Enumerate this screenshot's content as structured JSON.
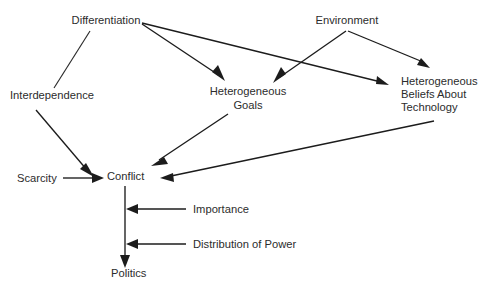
{
  "diagram": {
    "type": "directed-graph",
    "title": "",
    "background_color": "#ffffff",
    "text_color": "#2c2c2c",
    "line_color": "#1c1c1c",
    "nodes": [
      {
        "id": "differentiation",
        "label": "Differentiation",
        "lines": [
          "Differentiation"
        ],
        "x": 106,
        "y": 24,
        "align": "middle"
      },
      {
        "id": "environment",
        "label": "Environment",
        "lines": [
          "Environment"
        ],
        "x": 347,
        "y": 24,
        "align": "middle"
      },
      {
        "id": "interdependence",
        "label": "Interdependence",
        "lines": [
          "Interdependence"
        ],
        "x": 10,
        "y": 99,
        "align": "start"
      },
      {
        "id": "heterogeneous-goals",
        "label": "Heterogeneous Goals",
        "lines": [
          "Heterogeneous",
          "Goals"
        ],
        "x": 248,
        "y": 95,
        "align": "middle"
      },
      {
        "id": "heterogeneous-beliefs",
        "label": "Heterogeneous Beliefs About Technology",
        "lines": [
          "Heterogeneous",
          "Beliefs About",
          "Technology"
        ],
        "x": 401,
        "y": 85,
        "align": "start"
      },
      {
        "id": "scarcity",
        "label": "Scarcity",
        "lines": [
          "Scarcity"
        ],
        "x": 17,
        "y": 182,
        "align": "start"
      },
      {
        "id": "conflict",
        "label": "Conflict",
        "lines": [
          "Conflict"
        ],
        "x": 107,
        "y": 180,
        "align": "start"
      },
      {
        "id": "importance",
        "label": "Importance",
        "lines": [
          "Importance"
        ],
        "x": 193,
        "y": 213,
        "align": "start"
      },
      {
        "id": "distribution-of-power",
        "label": "Distribution of Power",
        "lines": [
          "Distribution of Power"
        ],
        "x": 193,
        "y": 248,
        "align": "start"
      },
      {
        "id": "politics",
        "label": "Politics",
        "lines": [
          "Politics"
        ],
        "x": 111,
        "y": 277,
        "align": "start"
      }
    ],
    "edges": [
      {
        "id": "edge-differentiation-interdependence",
        "from": "differentiation",
        "to": "interdependence",
        "arrowhead": false
      },
      {
        "id": "edge-differentiation-heterogeneous-goals",
        "from": "differentiation",
        "to": "heterogeneous-goals",
        "arrowhead": true
      },
      {
        "id": "edge-differentiation-heterogeneous-beliefs",
        "from": "differentiation",
        "to": "heterogeneous-beliefs",
        "arrowhead": true
      },
      {
        "id": "edge-environment-heterogeneous-goals",
        "from": "environment",
        "to": "heterogeneous-goals",
        "arrowhead": true
      },
      {
        "id": "edge-environment-heterogeneous-beliefs",
        "from": "environment",
        "to": "heterogeneous-beliefs",
        "arrowhead": true
      },
      {
        "id": "edge-interdependence-conflict",
        "from": "interdependence",
        "to": "conflict",
        "arrowhead": true
      },
      {
        "id": "edge-scarcity-conflict",
        "from": "scarcity",
        "to": "conflict",
        "arrowhead": true
      },
      {
        "id": "edge-heterogeneous-goals-conflict",
        "from": "heterogeneous-goals",
        "to": "conflict",
        "arrowhead": true
      },
      {
        "id": "edge-heterogeneous-beliefs-conflict",
        "from": "heterogeneous-beliefs",
        "to": "conflict",
        "arrowhead": true
      },
      {
        "id": "edge-conflict-politics",
        "from": "conflict",
        "to": "politics",
        "arrowhead": true
      },
      {
        "id": "edge-importance-conflict-politics",
        "from": "importance",
        "to": "conflict-politics-link",
        "arrowhead": true
      },
      {
        "id": "edge-distribution-of-power-conflict-politics",
        "from": "distribution-of-power",
        "to": "conflict-politics-link",
        "arrowhead": true
      }
    ]
  }
}
